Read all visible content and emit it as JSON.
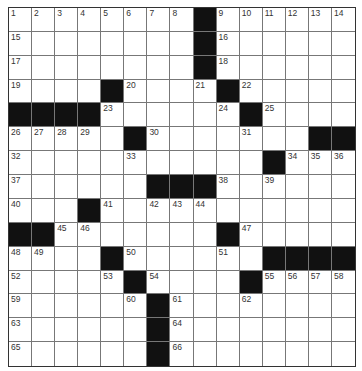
{
  "puzzle": {
    "rows": 15,
    "cols": 15,
    "colors": {
      "block": "#111111",
      "cell": "#ffffff",
      "line": "#777777"
    },
    "grid": [
      [
        "1",
        "2",
        "3",
        "4",
        "5",
        "6",
        "7",
        "8",
        "#",
        "9",
        "10",
        "11",
        "12",
        "13",
        "14"
      ],
      [
        "15",
        "",
        "",
        "",
        "",
        "",
        "",
        "",
        "#",
        "16",
        "",
        "",
        "",
        "",
        ""
      ],
      [
        "17",
        "",
        "",
        "",
        "",
        "",
        "",
        "",
        "#",
        "18",
        "",
        "",
        "",
        "",
        ""
      ],
      [
        "19",
        "",
        "",
        "",
        "#",
        "20",
        "",
        "",
        "21",
        "#",
        "22",
        "",
        "",
        "",
        ""
      ],
      [
        "#",
        "#",
        "#",
        "#",
        "23",
        "",
        "",
        "",
        "",
        "24",
        "#",
        "25",
        "",
        "",
        ""
      ],
      [
        "26",
        "27",
        "28",
        "29",
        "",
        "#",
        "30",
        "",
        "",
        "",
        "31",
        "",
        "",
        "#",
        "#"
      ],
      [
        "32",
        "",
        "",
        "",
        "",
        "33",
        "",
        "",
        "",
        "",
        "",
        "#",
        "34",
        "35",
        "36"
      ],
      [
        "37",
        "",
        "",
        "",
        "",
        "",
        "#",
        "#",
        "#",
        "38",
        "",
        "39",
        "",
        "",
        ""
      ],
      [
        "40",
        "",
        "",
        "#",
        "41",
        "",
        "42",
        "43",
        "44",
        "",
        "",
        "",
        "",
        "",
        ""
      ],
      [
        "#",
        "#",
        "45",
        "46",
        "",
        "",
        "",
        "",
        "",
        "#",
        "47",
        "",
        "",
        "",
        ""
      ],
      [
        "48",
        "49",
        "",
        "",
        "#",
        "50",
        "",
        "",
        "",
        "51",
        "",
        "#",
        "#",
        "#",
        "#"
      ],
      [
        "52",
        "",
        "",
        "",
        "53",
        "#",
        "54",
        "",
        "",
        "",
        "#",
        "55",
        "56",
        "57",
        "58"
      ],
      [
        "59",
        "",
        "",
        "",
        "",
        "60",
        "#",
        "61",
        "",
        "",
        "62",
        "",
        "",
        "",
        ""
      ],
      [
        "63",
        "",
        "",
        "",
        "",
        "",
        "#",
        "64",
        "",
        "",
        "",
        "",
        "",
        "",
        ""
      ],
      [
        "65",
        "",
        "",
        "",
        "",
        "",
        "#",
        "66",
        "",
        "",
        "",
        "",
        "",
        "",
        ""
      ]
    ]
  }
}
